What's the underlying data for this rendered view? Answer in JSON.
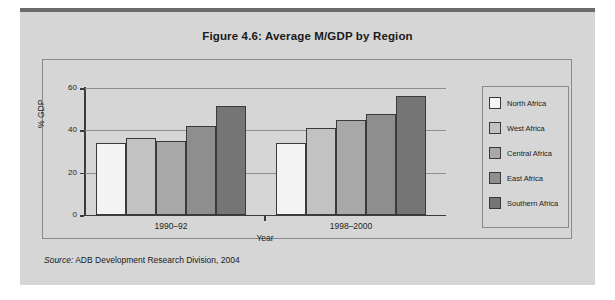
{
  "figure": {
    "title": "Figure 4.6:  Average M/GDP by Region",
    "source_label": "Source:",
    "source_text": "ADB Development Research Division, 2004"
  },
  "chart_data": {
    "type": "bar",
    "title": "Figure 4.6:  Average M/GDP by Region",
    "xlabel": "Year",
    "ylabel": "% GDP",
    "categories": [
      "1990–92",
      "1998–2000"
    ],
    "ylim": [
      0,
      60
    ],
    "yticks": [
      0,
      20,
      40,
      60
    ],
    "ytick_labels": [
      "0",
      "20",
      "40",
      "60"
    ],
    "grid": true,
    "legend_position": "right",
    "series": [
      {
        "name": "North Africa",
        "color": "#f4f4f4",
        "values": [
          34,
          34
        ]
      },
      {
        "name": "West Africa",
        "color": "#c2c2c2",
        "values": [
          36.5,
          41
        ]
      },
      {
        "name": "Central Africa",
        "color": "#a8a8a8",
        "values": [
          35,
          45
        ]
      },
      {
        "name": "East Africa",
        "color": "#8e8e8e",
        "values": [
          42,
          47.5
        ]
      },
      {
        "name": "Southern Africa",
        "color": "#757575",
        "values": [
          51.5,
          56
        ]
      }
    ]
  },
  "colors": {
    "panel_background": "#d6d6d6",
    "top_rule": "#6b6b6b",
    "frame_border": "#8a8a8a",
    "axis": "#3c3c3c",
    "gridline": "#8f8f8f"
  }
}
